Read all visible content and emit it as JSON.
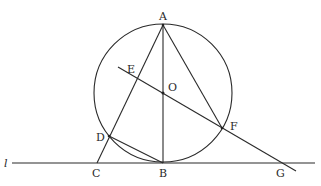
{
  "diagram": {
    "circle": {
      "center": "O",
      "cx": 163,
      "cy": 93,
      "r": 70
    },
    "line_name": "l",
    "labels": {
      "A": "A",
      "B": "B",
      "C": "C",
      "D": "D",
      "E": "E",
      "F": "F",
      "G": "G",
      "O": "O",
      "l": "l"
    },
    "points": {
      "A": [
        163,
        25
      ],
      "B": [
        163,
        163
      ],
      "C": [
        97,
        163
      ],
      "D": [
        109,
        136
      ],
      "E": [
        137,
        77
      ],
      "F": [
        222,
        128
      ],
      "G": [
        281,
        163
      ],
      "O": [
        163,
        93
      ]
    },
    "segments": [
      [
        "A",
        "B"
      ],
      [
        "A",
        "C"
      ],
      [
        "A",
        "F"
      ],
      [
        "D",
        "B"
      ],
      [
        "E",
        "G"
      ]
    ],
    "colors": {
      "stroke": "#2a2a2a",
      "background": "#ffffff"
    }
  }
}
